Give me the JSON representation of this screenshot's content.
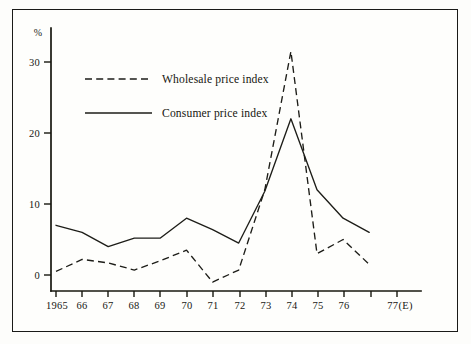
{
  "chart_data": {
    "type": "line",
    "title": "",
    "xlabel": "",
    "ylabel": "%",
    "y_unit_label": "%",
    "grid": false,
    "legend_position": "upper-left-inside",
    "categories": [
      "1965",
      "66",
      "67",
      "68",
      "69",
      "70",
      "71",
      "72",
      "73",
      "74",
      "75",
      "76",
      "77(E)"
    ],
    "x_tick_labels": [
      "1965",
      "66",
      "67",
      "68",
      "69",
      "70",
      "71",
      "72",
      "73",
      "74",
      "75",
      "76",
      "77(E)"
    ],
    "y_tick_labels": [
      "0",
      "10",
      "20",
      "30"
    ],
    "y_ticks": [
      0,
      10,
      20,
      30
    ],
    "ylim": [
      -2.5,
      34
    ],
    "xlim": [
      "1965",
      "77(E)"
    ],
    "series": [
      {
        "name": "Wholesale price index",
        "style": "dashed",
        "color": "#1d1d18",
        "values": [
          0.5,
          2.2,
          1.7,
          0.7,
          2.0,
          3.5,
          -1.0,
          0.7,
          12.0,
          31.5,
          3.0,
          5.0,
          1.5
        ]
      },
      {
        "name": "Consumer price index",
        "style": "solid",
        "color": "#1d1d18",
        "values": [
          7.0,
          6.0,
          4.0,
          5.2,
          5.2,
          8.0,
          6.4,
          4.5,
          11.8,
          22.0,
          12.0,
          8.0,
          6.0
        ]
      }
    ]
  },
  "legend": {
    "entries": [
      {
        "label": "Wholesale price index",
        "style": "dashed"
      },
      {
        "label": "Consumer price index",
        "style": "solid"
      }
    ]
  },
  "axes": {
    "y_unit": "%",
    "y_labels": [
      "30",
      "20",
      "10",
      "0"
    ],
    "x_labels": [
      "1965",
      "66",
      "67",
      "68",
      "69",
      "70",
      "71",
      "72",
      "73",
      "74",
      "75",
      "76",
      "77(E)"
    ]
  },
  "colors": {
    "ink": "#1d1d18",
    "frame": "#1a1a18",
    "paper": "#fefefc"
  }
}
